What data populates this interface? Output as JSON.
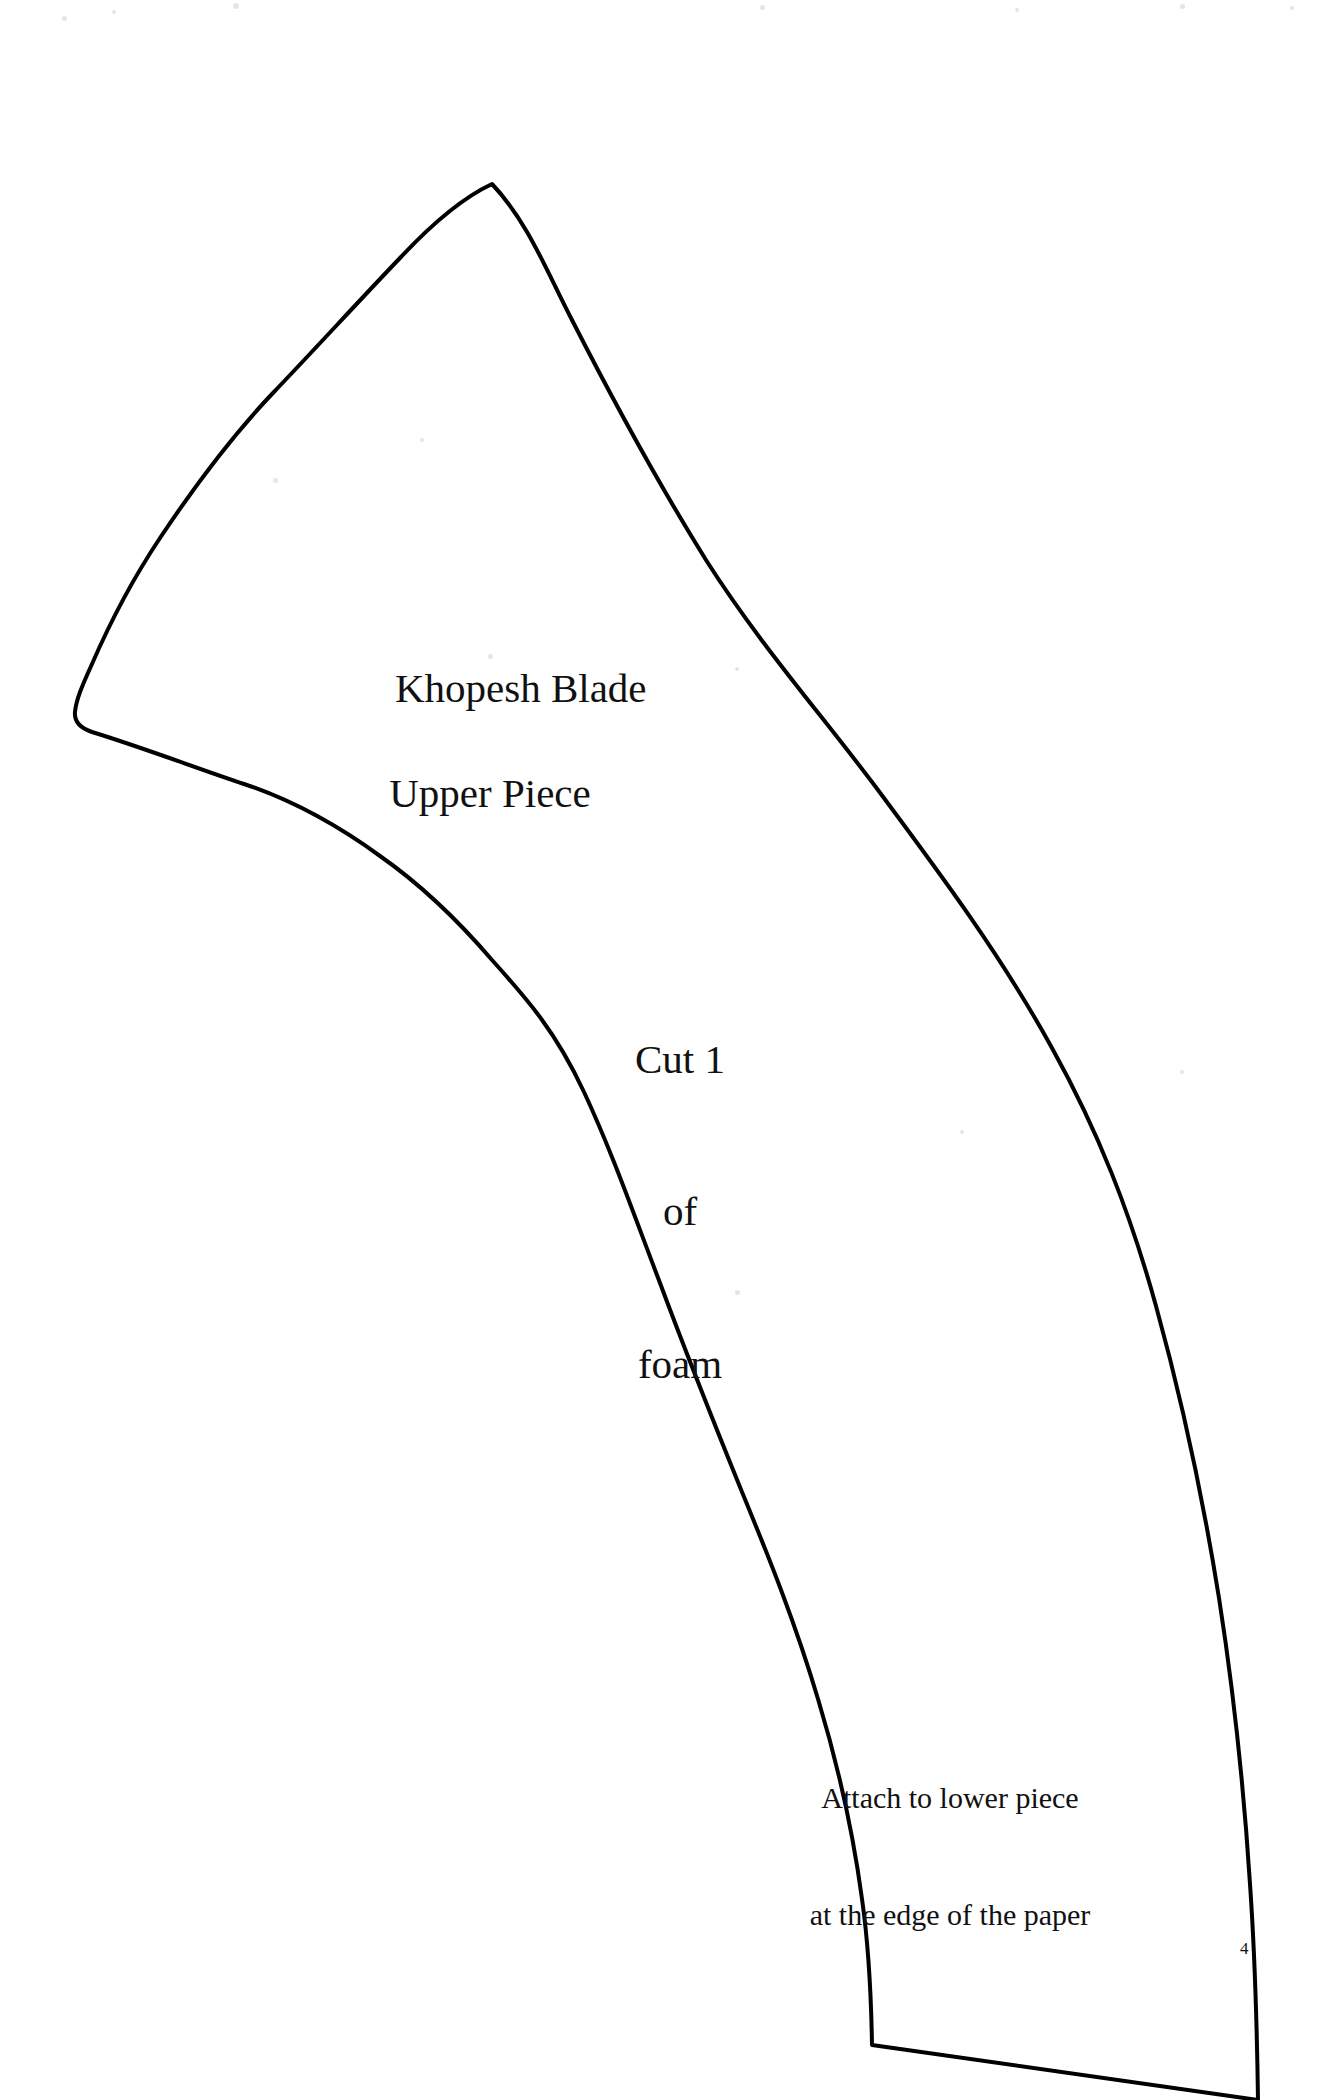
{
  "document": {
    "kind": "craft-pattern-template",
    "page_number": "4",
    "background_color": "#ffffff",
    "ink_color": "#000000"
  },
  "labels": {
    "title_line1": "Khopesh Blade",
    "title_line2": "Upper Piece",
    "cut_line1": "Cut 1",
    "cut_line2": "of",
    "cut_line3": "foam",
    "attach_line1": "Attach to lower piece",
    "attach_line2": "at the edge of the paper"
  },
  "shape": {
    "name": "khopesh-blade-upper-piece-outline",
    "stroke_color": "#000000",
    "stroke_width": 4,
    "fill": "none",
    "path": "M 492 184 C 528 222 547 272 572 320 C 620 414 660 486 706 560 C 760 645 822 715 878 790 C 942 876 1002 957 1052 1048 C 1098 1131 1130 1212 1156 1306 C 1182 1400 1203 1498 1219 1598 C 1234 1694 1244 1790 1250 1884 C 1255 1956 1257 2028 1258 2100 L 1258 2100 L 872 2045 C 871 1985 868 1941 862 1899 C 853 1832 838 1765 818 1699 C 796 1625 770 1560 742 1492 C 714 1423 686 1353 660 1283 C 634 1215 612 1152 584 1092 C 556 1032 528 1000 492 960 C 456 918 420 884 380 856 C 336 824 292 800 244 784 C 196 768 144 748 92 732 C 80 728 74 722 75 712 C 76 700 82 686 92 664 C 112 618 132 580 160 538 C 196 484 232 436 272 394 C 316 348 356 304 400 258 C 428 228 462 198 492 184 Z"
  },
  "specks": [
    {
      "x": 62,
      "y": 16,
      "size": 5
    },
    {
      "x": 112,
      "y": 10,
      "size": 4
    },
    {
      "x": 233,
      "y": 3,
      "size": 6
    },
    {
      "x": 760,
      "y": 5,
      "size": 5
    },
    {
      "x": 1015,
      "y": 8,
      "size": 4
    },
    {
      "x": 1180,
      "y": 4,
      "size": 5
    },
    {
      "x": 1290,
      "y": 6,
      "size": 4
    },
    {
      "x": 273,
      "y": 478,
      "size": 5
    },
    {
      "x": 420,
      "y": 438,
      "size": 4
    },
    {
      "x": 488,
      "y": 654,
      "size": 5
    },
    {
      "x": 735,
      "y": 667,
      "size": 4
    },
    {
      "x": 735,
      "y": 1290,
      "size": 5
    },
    {
      "x": 960,
      "y": 1130,
      "size": 4
    },
    {
      "x": 1180,
      "y": 1070,
      "size": 4
    }
  ]
}
